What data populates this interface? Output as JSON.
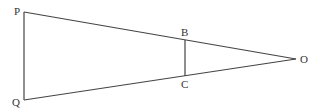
{
  "diagram": {
    "type": "geometry",
    "line_color": "#444444",
    "points": {
      "P": {
        "label": "P",
        "x": 24,
        "y": 12
      },
      "Q": {
        "label": "Q",
        "x": 24,
        "y": 100
      },
      "O": {
        "label": "O",
        "x": 296,
        "y": 59
      },
      "B": {
        "label": "B",
        "x": 185,
        "y": 40
      },
      "C": {
        "label": "C",
        "x": 185,
        "y": 76
      }
    },
    "segments": [
      [
        "P",
        "Q"
      ],
      [
        "P",
        "O"
      ],
      [
        "Q",
        "O"
      ],
      [
        "B",
        "C"
      ]
    ]
  }
}
